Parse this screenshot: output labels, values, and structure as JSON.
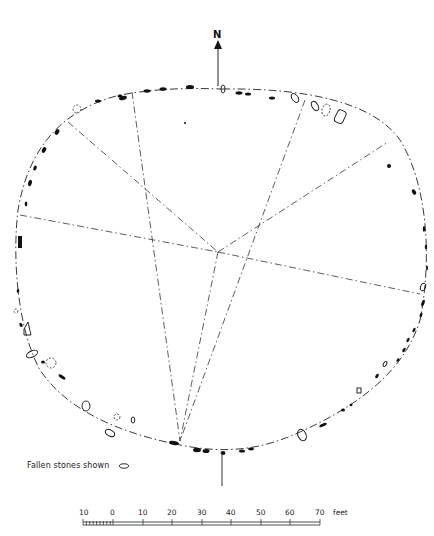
{
  "diagram": {
    "type": "stone-circle-site-plan",
    "north_label": "N",
    "legend": {
      "text": "Fallen stones shown",
      "symbol": "outlined-stone-icon"
    },
    "scale_bar": {
      "unit_label": "feet",
      "ticks": [
        "10",
        "0",
        "10",
        "20",
        "30",
        "40",
        "50",
        "60",
        "70"
      ]
    },
    "elements": {
      "outline": "dash-dot ellipse perimeter",
      "center_lines": 5,
      "standing_stones": "solid black",
      "fallen_stones": "outline only",
      "stone_holes": "dashed outline"
    },
    "colors": {
      "ink": "#111111",
      "paper": "#ffffff"
    }
  }
}
